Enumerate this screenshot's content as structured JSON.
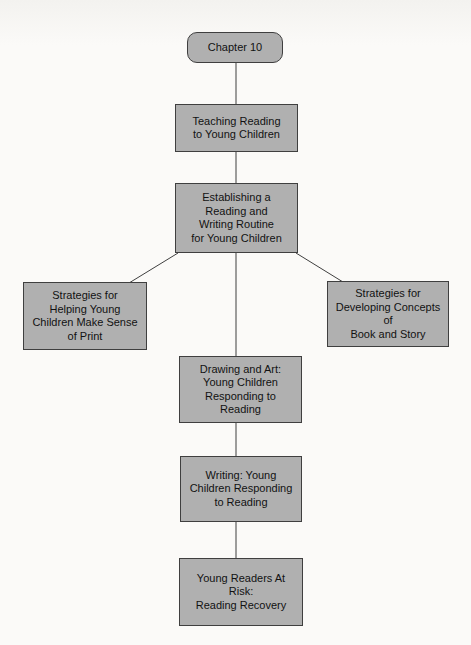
{
  "nodes": [
    {
      "id": "chapter-10",
      "label": "Chapter 10",
      "shape": "rounded"
    },
    {
      "id": "teaching-reading",
      "label": "Teaching Reading\nto Young Children",
      "shape": "rect"
    },
    {
      "id": "establishing-routine",
      "label": "Establishing a\nReading and\nWriting Routine\nfor Young Children",
      "shape": "rect"
    },
    {
      "id": "strategies-print",
      "label": "Strategies for\nHelping Young\nChildren Make Sense\nof Print",
      "shape": "rect"
    },
    {
      "id": "strategies-book-story",
      "label": "Strategies for\nDeveloping Concepts of\nBook and Story",
      "shape": "rect"
    },
    {
      "id": "drawing-and-art",
      "label": "Drawing and Art:\nYoung Children\nResponding to\nReading",
      "shape": "rect"
    },
    {
      "id": "writing",
      "label": "Writing: Young\nChildren Responding\nto Reading",
      "shape": "rect"
    },
    {
      "id": "young-readers-at-risk",
      "label": "Young Readers At\nRisk:\nReading Recovery",
      "shape": "rect"
    }
  ],
  "edges": [
    {
      "from": "chapter-10",
      "to": "teaching-reading"
    },
    {
      "from": "teaching-reading",
      "to": "establishing-routine"
    },
    {
      "from": "establishing-routine",
      "to": "strategies-print"
    },
    {
      "from": "establishing-routine",
      "to": "strategies-book-story"
    },
    {
      "from": "establishing-routine",
      "to": "drawing-and-art"
    },
    {
      "from": "drawing-and-art",
      "to": "writing"
    },
    {
      "from": "writing",
      "to": "young-readers-at-risk"
    }
  ],
  "colors": {
    "node_fill": "#b0b0b0",
    "node_border": "#3f3f3f",
    "connector": "#3f3f3f",
    "text": "#121212",
    "background": "#fbfaf8"
  }
}
